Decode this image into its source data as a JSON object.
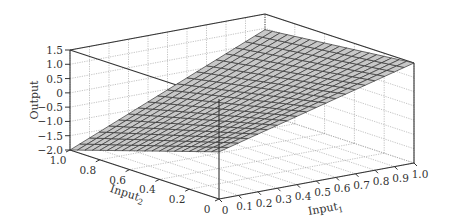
{
  "chart_data": {
    "type": "surface3d",
    "title": "",
    "xlabel": "Input",
    "xlabel_sub": "1",
    "ylabel": "Input",
    "ylabel_sub": "2",
    "zlabel": "Output",
    "xlim": [
      0,
      1.0
    ],
    "ylim": [
      0,
      1.0
    ],
    "zlim": [
      -2.0,
      1.5
    ],
    "x_ticks": [
      "0",
      "0.1",
      "0.2",
      "0.3",
      "0.4",
      "0.5",
      "0.6",
      "0.7",
      "0.8",
      "0.9",
      "1.0"
    ],
    "x_tick_values": [
      0,
      0.1,
      0.2,
      0.3,
      0.4,
      0.5,
      0.6,
      0.7,
      0.8,
      0.9,
      1.0
    ],
    "y_ticks": [
      "0",
      "0.2",
      "0.4",
      "0.6",
      "0.8",
      "1.0"
    ],
    "y_tick_values": [
      0,
      0.2,
      0.4,
      0.6,
      0.8,
      1.0
    ],
    "z_ticks": [
      "1.5",
      "1.0",
      "0.5",
      "0",
      "−0.5",
      "−1.0",
      "−1.5",
      "−2.0"
    ],
    "z_tick_values": [
      1.5,
      1.0,
      0.5,
      0,
      -0.5,
      -1.0,
      -1.5,
      -2.0
    ],
    "grid": true,
    "surface": {
      "model": "bilinear",
      "corners": {
        "x0_y0": -0.35,
        "x1_y0": 1.5,
        "x0_y1": -2.0,
        "x1_y1": 0.95
      },
      "mesh_divisions": 20,
      "face_color": "#c8c8c8",
      "edge_color": "#333333"
    },
    "legend": "none"
  }
}
